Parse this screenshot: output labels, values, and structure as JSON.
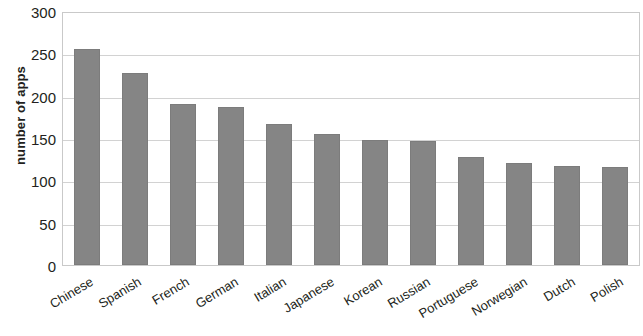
{
  "chart_data": {
    "type": "bar",
    "title": "",
    "subtitle": "",
    "xlabel": "",
    "ylabel": "number of apps",
    "categories": [
      "Chinese",
      "Spanish",
      "French",
      "German",
      "Italian",
      "Japanese",
      "Korean",
      "Russian",
      "Portuguese",
      "Norwegian",
      "Dutch",
      "Polish"
    ],
    "values": [
      255,
      227,
      190,
      187,
      166,
      155,
      148,
      146,
      127,
      121,
      117,
      116
    ],
    "series": [
      {
        "name": "number of apps",
        "values": [
          255,
          227,
          190,
          187,
          166,
          155,
          148,
          146,
          127,
          121,
          117,
          116
        ]
      }
    ],
    "ylim": [
      0,
      300
    ],
    "ytick_labels": [
      "300",
      "250",
      "200",
      "150",
      "100",
      "50",
      "0"
    ],
    "ytick_values": [
      300,
      250,
      200,
      150,
      100,
      50,
      0
    ],
    "grid": true,
    "grid_axis": "y",
    "legend": false,
    "legend_position": "none",
    "bar_color": "#858585",
    "grid_color": "#d2d2d2",
    "axis_color": "#c9c9c9",
    "text_color": "#231f20",
    "xtick_label_rotation": -31,
    "annotations": []
  }
}
